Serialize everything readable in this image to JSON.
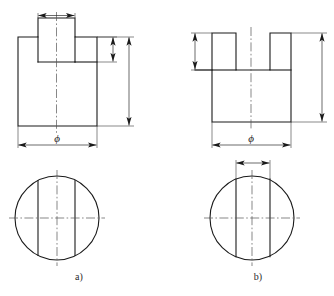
{
  "page": {
    "background": "#ffffff",
    "line_color": "#1a1a1a",
    "center_line_color": "#555555",
    "width": 334,
    "height": 296,
    "top_text_remnant": ""
  },
  "figures": [
    {
      "id": "a",
      "caption": "a)",
      "front_view": {
        "shape_name": "t-shaped-boss-block",
        "description": "T-shaped front view: rectangular base block with a raised rectangular boss on top",
        "dimensions": [
          {
            "name": "boss-width",
            "label": "",
            "orientation": "horizontal",
            "position": "above-boss"
          },
          {
            "name": "boss-height",
            "label": "",
            "orientation": "vertical",
            "position": "right-inner"
          },
          {
            "name": "total-height",
            "label": "",
            "orientation": "vertical",
            "position": "right-outer"
          },
          {
            "name": "diameter",
            "label": "ϕ",
            "orientation": "horizontal",
            "position": "below-block"
          }
        ]
      },
      "top_view": {
        "shape_name": "circle-with-two-chords",
        "description": "Circle with two vertical chord lines and horizontal plus vertical centerlines",
        "chords": 2,
        "has_dimension": false
      }
    },
    {
      "id": "b",
      "caption": "b)",
      "front_view": {
        "shape_name": "u-shaped-slotted-block",
        "description": "U-shaped front view: rectangular block with a rectangular slot cut into the top",
        "dimensions": [
          {
            "name": "slot-depth",
            "label": "",
            "orientation": "vertical",
            "position": "left-outer"
          },
          {
            "name": "total-height",
            "label": "",
            "orientation": "vertical",
            "position": "right-outer"
          },
          {
            "name": "diameter",
            "label": "ϕ",
            "orientation": "horizontal",
            "position": "below-block"
          }
        ]
      },
      "top_view": {
        "shape_name": "circle-with-two-chords-and-width-dimension",
        "description": "Circle with two vertical chord lines extended above to a horizontal width dimension",
        "chords": 2,
        "has_dimension": true,
        "dimension": {
          "name": "slot-width",
          "label": "",
          "orientation": "horizontal",
          "position": "above-circle"
        }
      }
    }
  ],
  "symbols": {
    "phi": "ϕ"
  }
}
